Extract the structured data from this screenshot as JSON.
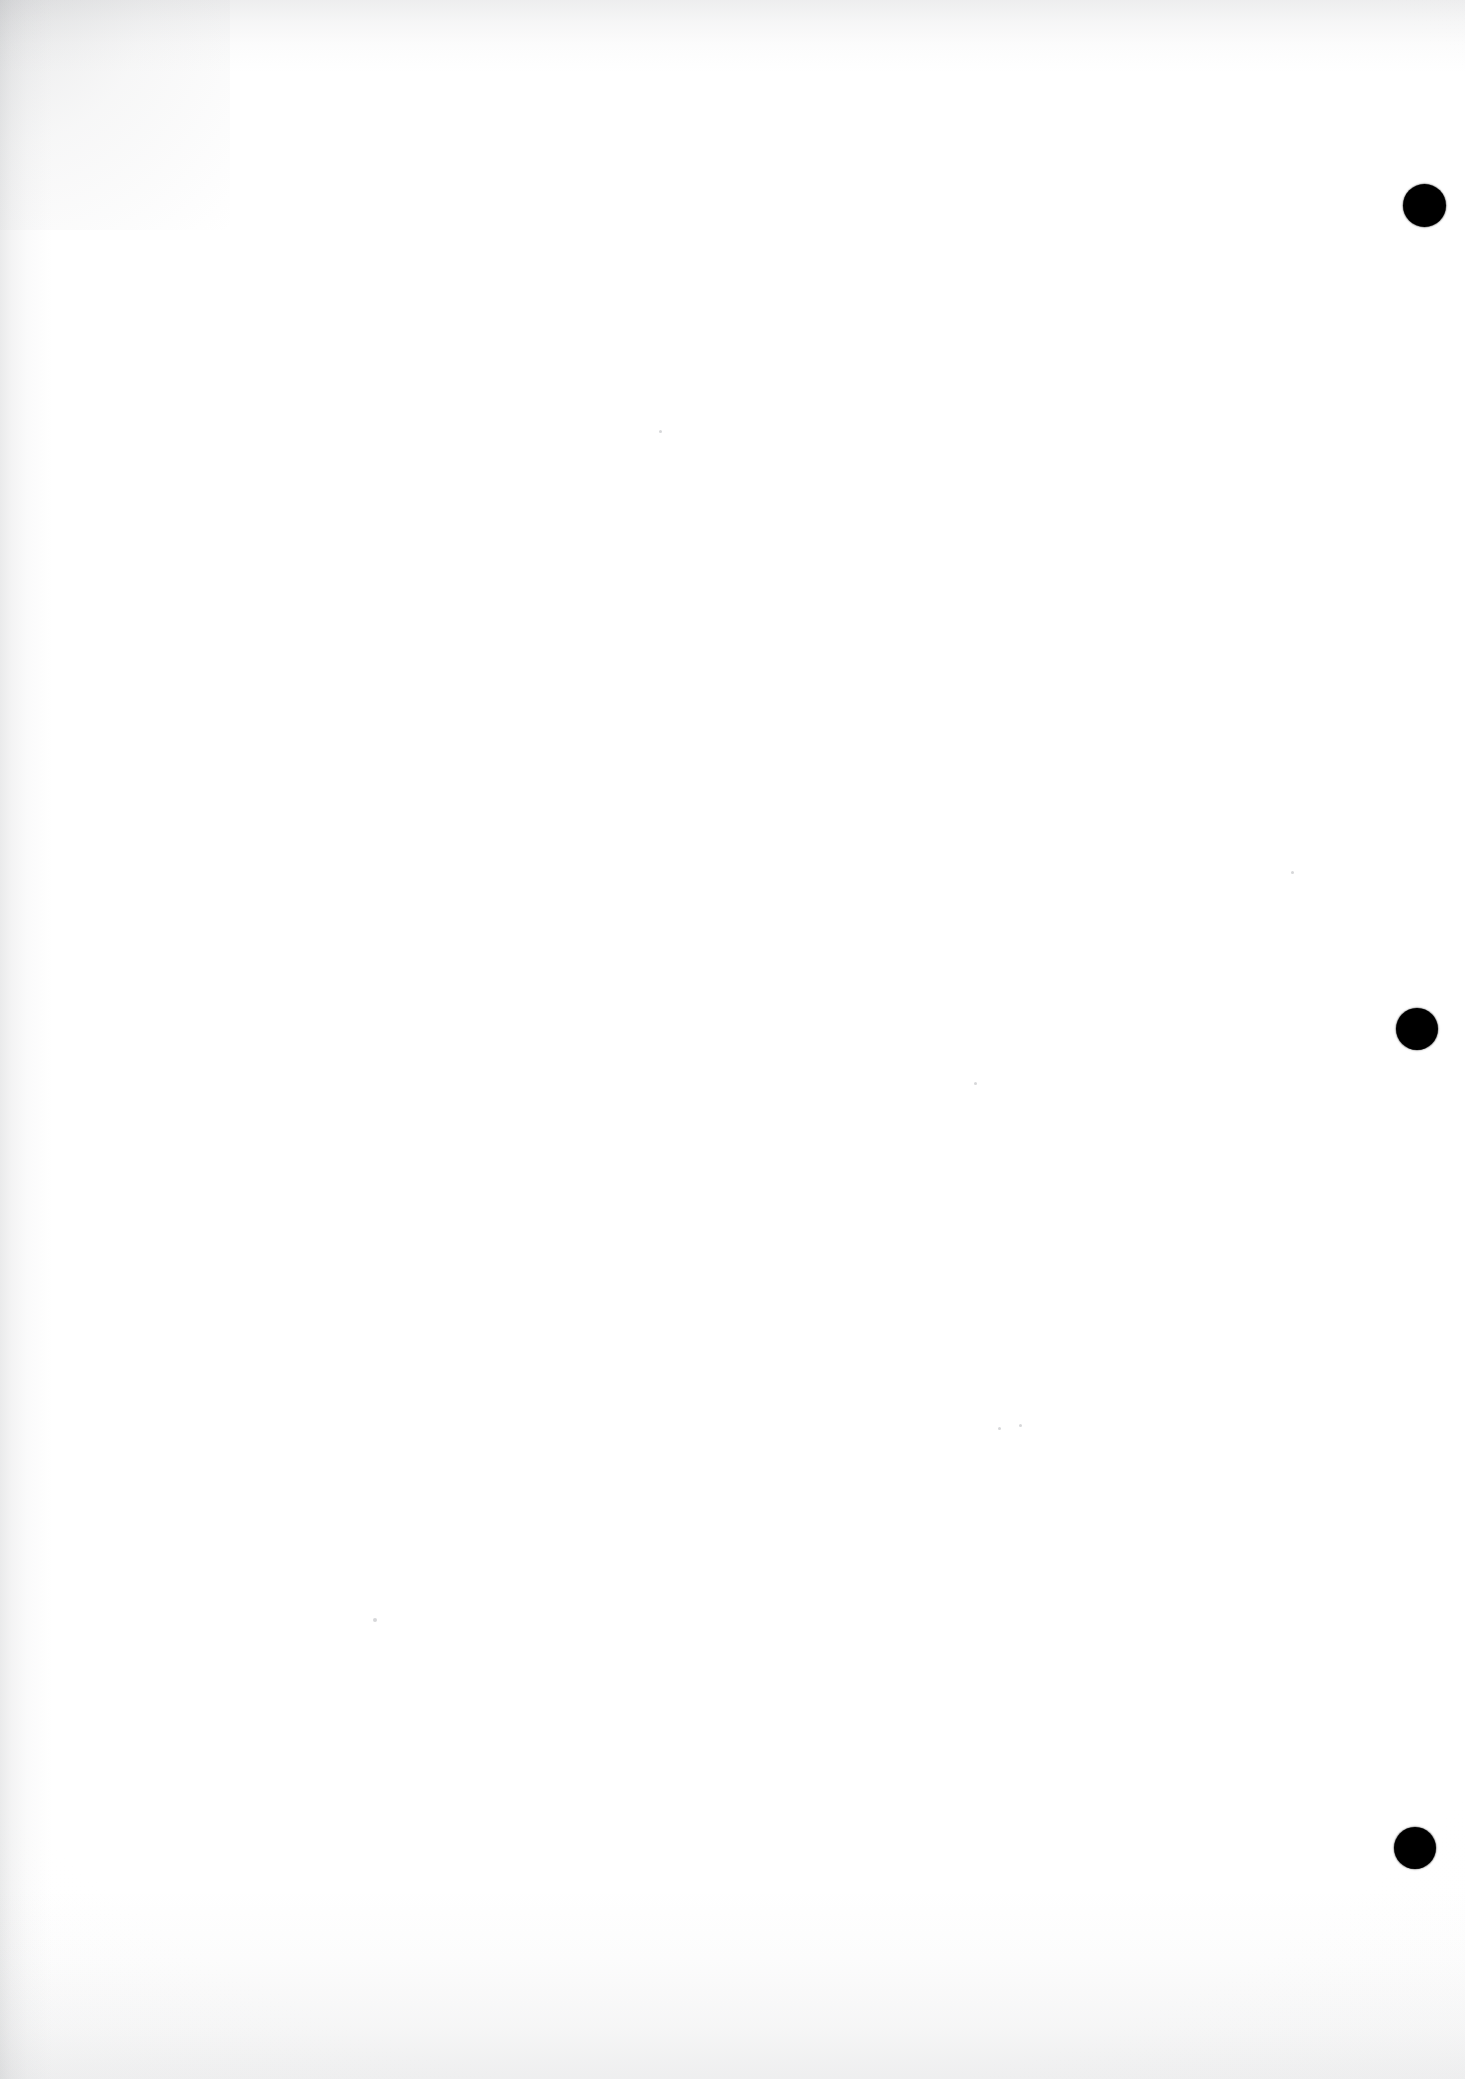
{
  "page": {
    "label": "scanned blank page",
    "width": 1465,
    "height": 2079,
    "background_color": "#fefefe",
    "content_text": "",
    "note": "blank page - no text content"
  },
  "marks": {
    "ink_color": "#000000",
    "registration_dots": [
      {
        "name": "registration-dot-top",
        "cx": 1424,
        "cy": 205,
        "d": 43
      },
      {
        "name": "registration-dot-middle",
        "cx": 1417,
        "cy": 1029,
        "d": 42
      },
      {
        "name": "registration-dot-bottom",
        "cx": 1415,
        "cy": 1848,
        "d": 42
      }
    ],
    "dust_specks": [
      {
        "cx": 375,
        "cy": 1620,
        "d": 4
      },
      {
        "cx": 1020,
        "cy": 1425,
        "d": 3
      },
      {
        "cx": 999,
        "cy": 1428,
        "d": 3
      },
      {
        "cx": 1292,
        "cy": 872,
        "d": 3
      },
      {
        "cx": 975,
        "cy": 1083,
        "d": 3
      },
      {
        "cx": 660,
        "cy": 431,
        "d": 3
      }
    ]
  },
  "scan_artifacts": {
    "edge_shadow_color": "#96989c",
    "edges": [
      "left",
      "top",
      "bottom"
    ]
  }
}
